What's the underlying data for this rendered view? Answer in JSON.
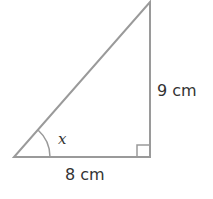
{
  "diagram": {
    "type": "right-triangle",
    "labels": {
      "base": "8 cm",
      "height": "9 cm",
      "angle": "x"
    },
    "stroke_color": "#9a9a9a",
    "text_color": "#333333"
  }
}
